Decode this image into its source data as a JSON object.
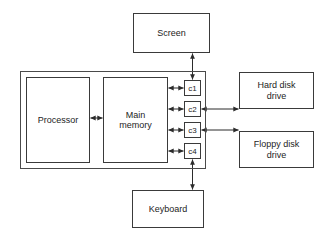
{
  "diagram": {
    "stroke_color": "#2b2b2b",
    "box_fill": "#ffffff",
    "background": "#ffffff"
  },
  "system_unit": {
    "label": ""
  },
  "components": {
    "processor": "Processor",
    "main_memory": "Main\nmemory",
    "screen": "Screen",
    "keyboard": "Keyboard",
    "hard_disk": "Hard disk\ndrive",
    "floppy_disk": "Floppy disk\ndrive"
  },
  "controllers": [
    {
      "id": "c1",
      "label": "c1",
      "connects_to": "Screen"
    },
    {
      "id": "c2",
      "label": "c2",
      "connects_to": "Hard disk drive"
    },
    {
      "id": "c3",
      "label": "c3",
      "connects_to": "Floppy disk drive"
    },
    {
      "id": "c4",
      "label": "c4",
      "connects_to": "Keyboard"
    }
  ],
  "connections": [
    {
      "from": "Processor",
      "to": "Main memory",
      "type": "bidirectional"
    },
    {
      "from": "Main memory",
      "to": "c1",
      "type": "bidirectional"
    },
    {
      "from": "Main memory",
      "to": "c2",
      "type": "bidirectional"
    },
    {
      "from": "Main memory",
      "to": "c3",
      "type": "bidirectional"
    },
    {
      "from": "Main memory",
      "to": "c4",
      "type": "bidirectional"
    },
    {
      "from": "c1",
      "to": "Screen",
      "type": "bidirectional"
    },
    {
      "from": "c2",
      "to": "Hard disk drive",
      "type": "bidirectional"
    },
    {
      "from": "c3",
      "to": "Floppy disk drive",
      "type": "bidirectional"
    },
    {
      "from": "c4",
      "to": "Keyboard",
      "type": "bidirectional"
    }
  ]
}
